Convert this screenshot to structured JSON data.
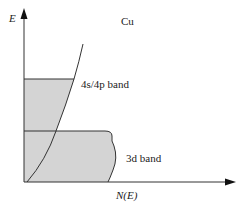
{
  "diagram": {
    "title": "Cu",
    "y_axis_label": "E",
    "x_axis_label": "N(E)",
    "bands": [
      {
        "name": "4s/4p band",
        "label": "4s/4p band"
      },
      {
        "name": "3d band",
        "label": "3d band"
      }
    ],
    "colors": {
      "fill": "#d4d4d4",
      "line": "#333333",
      "background": "#ffffff"
    }
  }
}
